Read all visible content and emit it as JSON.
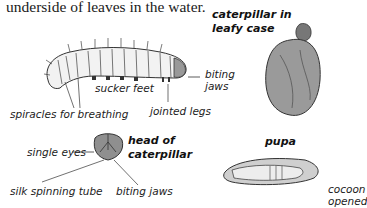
{
  "intro_text": "underside of leaves in the water.",
  "caterpillar": {
    "labels": {
      "spiracles": "spiracles for breathing",
      "sucker_feet": "sucker feet",
      "jointed_legs": "jointed legs",
      "biting_jaws_1": "biting",
      "biting_jaws_2": "jaws"
    }
  },
  "leafy_case": {
    "title_1": "caterpillar in",
    "title_2": "leafy case"
  },
  "head": {
    "title_1": "head of",
    "title_2": "caterpillar",
    "labels": {
      "single_eyes": "single eyes",
      "silk_tube": "silk spinning tube",
      "biting_jaws": "biting jaws"
    }
  },
  "pupa": {
    "title": "pupa",
    "label_1": "cocoon",
    "label_2": "opened"
  },
  "colors": {
    "ink": "#222222",
    "shade": "#8a8a8a",
    "background": "#ffffff"
  }
}
